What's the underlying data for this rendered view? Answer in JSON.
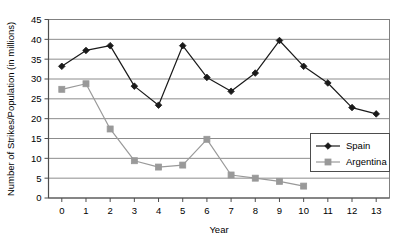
{
  "chart_data": {
    "type": "line",
    "title": "",
    "subtitle": "",
    "xlabel": "Year",
    "ylabel": "Number of Strikes/Population (in millions)",
    "x": [
      0,
      1,
      2,
      3,
      4,
      5,
      6,
      7,
      8,
      9,
      10,
      11,
      12,
      13
    ],
    "xtick_labels": [
      "0",
      "1",
      "2",
      "3",
      "4",
      "5",
      "6",
      "7",
      "8",
      "9",
      "10",
      "11",
      "12",
      "13"
    ],
    "ytick_labels": [
      "0",
      "5",
      "10",
      "15",
      "20",
      "25",
      "30",
      "35",
      "40",
      "45"
    ],
    "yticks": [
      0,
      5,
      10,
      15,
      20,
      25,
      30,
      35,
      40,
      45
    ],
    "xlim": [
      -0.55,
      13.55
    ],
    "ylim": [
      0,
      45
    ],
    "grid": "horizontal",
    "legend_position": "inside-right",
    "series": [
      {
        "name": "Spain",
        "marker": "diamond",
        "color": "#1a1a1a",
        "x": [
          0,
          1,
          2,
          3,
          4,
          5,
          6,
          7,
          8,
          9,
          10,
          11,
          12,
          13
        ],
        "values": [
          33.2,
          37.2,
          38.4,
          28.2,
          23.4,
          38.4,
          30.4,
          26.9,
          31.5,
          39.7,
          33.2,
          29.0,
          22.8,
          21.2
        ]
      },
      {
        "name": "Argentina",
        "marker": "square",
        "color": "#999999",
        "x": [
          0,
          1,
          2,
          3,
          4,
          5,
          6,
          7,
          8,
          9,
          10
        ],
        "values": [
          27.4,
          28.8,
          17.4,
          9.4,
          7.8,
          8.3,
          14.8,
          5.8,
          5.0,
          4.2,
          3.0
        ]
      }
    ]
  },
  "legend": {
    "entries": [
      {
        "label": "Spain"
      },
      {
        "label": "Argentina"
      }
    ]
  },
  "axes": {
    "x_title": "Year",
    "y_title": "Number of Strikes/Population (in millions)"
  },
  "colors": {
    "spain": "#1a1a1a",
    "argentina": "#999999",
    "gridline": "#8c8c8c",
    "axis": "#4d4d4d",
    "plot_border": "#808080",
    "background": "#ffffff"
  }
}
